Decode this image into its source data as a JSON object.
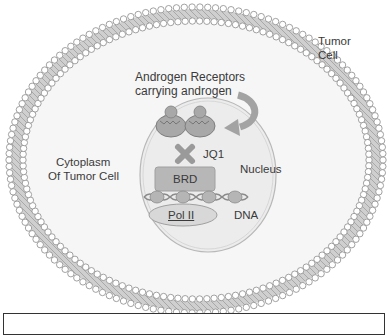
{
  "labels": {
    "tumor_cell": [
      "Tumor",
      "Cell"
    ],
    "androgen_receptors": [
      "Androgen Receptors",
      "carrying androgen"
    ],
    "jq1": "JQ1",
    "nucleus": "Nucleus",
    "brd": "BRD",
    "dna": "DNA",
    "pol2": "Pol II",
    "cytoplasm": [
      "Cytoplasm",
      "Of Tumor Cell"
    ]
  },
  "colors": {
    "membrane_head": "#ffffff",
    "membrane_stroke": "#8a8a8a",
    "membrane_tail": "#c9c9c9",
    "nucleus_fill": "#ececec",
    "nucleus_stroke": "#b5b5b5",
    "receptor_fill": "#a9a9a9",
    "brd_fill": "#b8b8b8",
    "x_mark": "#9a9a9a",
    "pol2_fill": "#d6d6d6",
    "arrow": "#a3a3a3"
  }
}
